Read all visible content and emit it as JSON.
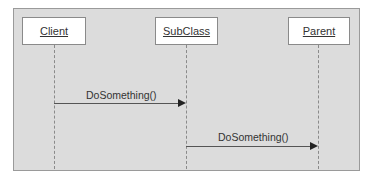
{
  "diagram": {
    "type": "sequence-diagram",
    "participants": [
      {
        "label": "Client"
      },
      {
        "label": "SubClass"
      },
      {
        "label": "Parent"
      }
    ],
    "messages": [
      {
        "from": "Client",
        "to": "SubClass",
        "label": "DoSomething()"
      },
      {
        "from": "SubClass",
        "to": "Parent",
        "label": "DoSomething()"
      }
    ],
    "colors": {
      "frame_background": "#dcdcdc",
      "frame_border": "#9a9a9a",
      "box_background": "#ffffff",
      "line": "#555555"
    }
  }
}
